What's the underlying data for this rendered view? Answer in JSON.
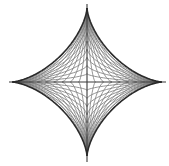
{
  "figure": {
    "shape": "astroid",
    "center": [
      87,
      82
    ],
    "radius_x": 75,
    "radius_y": 74,
    "grid_lines_per_side": 8,
    "colors": {
      "background": "#ffffff",
      "outline": "#2a2a2a",
      "grid": "#7a7a7a",
      "axis": "#3a3a3a"
    }
  }
}
